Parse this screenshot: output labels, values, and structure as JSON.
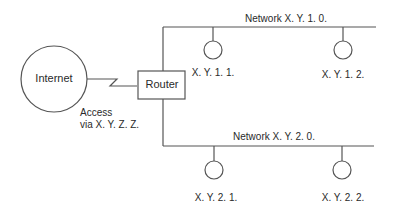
{
  "diagram": {
    "internet": {
      "label": "Internet"
    },
    "router": {
      "label": "Router"
    },
    "access": {
      "line1": "Access",
      "line2": "via X. Y. Z. Z."
    },
    "networks": [
      {
        "label": "Network X. Y. 1. 0.",
        "hosts": [
          {
            "label": "X. Y. 1. 1."
          },
          {
            "label": "X. Y. 1. 2."
          }
        ]
      },
      {
        "label": "Network X. Y. 2. 0.",
        "hosts": [
          {
            "label": "X. Y. 2. 1."
          },
          {
            "label": "X. Y. 2. 2."
          }
        ]
      }
    ],
    "colors": {
      "line": "#555555",
      "text": "#2a2a2a",
      "background": "#ffffff"
    }
  }
}
